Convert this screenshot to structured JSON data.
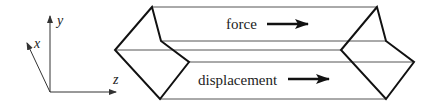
{
  "axes": {
    "x_label": "x",
    "y_label": "y",
    "z_label": "z"
  },
  "labels": {
    "force": "force",
    "displacement": "displacement"
  },
  "colors": {
    "stroke": "#111111",
    "thin_line": "#555555",
    "text": "#222222"
  }
}
